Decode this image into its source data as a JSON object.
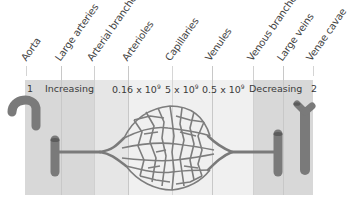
{
  "diagram": {
    "type": "blood-vessel-sequence",
    "vessel_labels": [
      "Aorta",
      "Large arteries",
      "Arterial branches",
      "Arterioles",
      "Capillaries",
      "Venules",
      "Venous branches",
      "Large veins",
      "Venae cavae"
    ],
    "row_labels": {
      "aorta_count": "1",
      "large_arteries": "Increasing",
      "arterioles_mantissa": "0.16 x 10",
      "arterioles_exp": "9",
      "capillaries_mantissa": "5 x 10",
      "capillaries_exp": "9",
      "venules_mantissa": "0.5 x 10",
      "venules_exp": "9",
      "venous_branches": "Decreasing",
      "venae_cavae_count": "2"
    },
    "colors": {
      "band_dark": "#d6d6d6",
      "band_mid": "#e2e2e2",
      "band_light": "#eeeeee",
      "vessel": "#7d7d7d",
      "vessel_dark": "#5e5e5e",
      "divider": "#c8c8c8"
    }
  }
}
